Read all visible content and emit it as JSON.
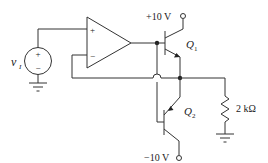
{
  "diagram": {
    "type": "circuit-schematic",
    "source": {
      "label_main": "v",
      "label_sub": "I",
      "plus": "+",
      "minus": "−"
    },
    "opamp": {
      "plus": "+",
      "minus": "−"
    },
    "transistors": [
      {
        "name": "Q1",
        "label_main": "Q",
        "label_sub": "1",
        "type": "NPN"
      },
      {
        "name": "Q2",
        "label_main": "Q",
        "label_sub": "2",
        "type": "PNP"
      }
    ],
    "supplies": {
      "positive": "+10 V",
      "negative": "−10 V"
    },
    "load": {
      "label": "2 kΩ"
    },
    "colors": {
      "line": "#333333",
      "background": "#ffffff"
    }
  }
}
